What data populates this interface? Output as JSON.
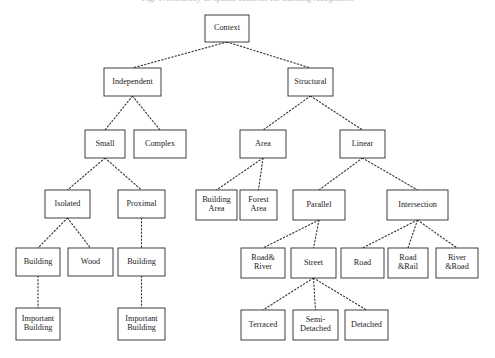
{
  "figure": {
    "caption": "Fig. 1. Hierarchy of spatial contexts for building recognition",
    "edge_style": "dotted",
    "box_stroke_color": "#2a2a2a",
    "box_fill_color": "#ffffff",
    "background_color": "#ffffff"
  },
  "nodes": [
    {
      "id": "context",
      "label": "Context",
      "lines": [
        "Context"
      ],
      "x": 205,
      "y": 15,
      "w": 44,
      "h": 27
    },
    {
      "id": "independent",
      "label": "Independent",
      "lines": [
        "Independent"
      ],
      "x": 104,
      "y": 68,
      "w": 57,
      "h": 28
    },
    {
      "id": "structural",
      "label": "Structural",
      "lines": [
        "Structural"
      ],
      "x": 288,
      "y": 68,
      "w": 45,
      "h": 28
    },
    {
      "id": "small",
      "label": "Small",
      "lines": [
        "Small"
      ],
      "x": 85,
      "y": 130,
      "w": 40,
      "h": 28
    },
    {
      "id": "complex",
      "label": "Complex",
      "lines": [
        "Complex"
      ],
      "x": 134,
      "y": 130,
      "w": 52,
      "h": 28
    },
    {
      "id": "area",
      "label": "Area",
      "lines": [
        "Area"
      ],
      "x": 240,
      "y": 130,
      "w": 46,
      "h": 28
    },
    {
      "id": "linear",
      "label": "Linear",
      "lines": [
        "Linear"
      ],
      "x": 340,
      "y": 130,
      "w": 45,
      "h": 28
    },
    {
      "id": "isolated",
      "label": "Isolated",
      "lines": [
        "Isolated"
      ],
      "x": 45,
      "y": 190,
      "w": 45,
      "h": 28
    },
    {
      "id": "proximal",
      "label": "Proximal",
      "lines": [
        "Proximal"
      ],
      "x": 118,
      "y": 190,
      "w": 47,
      "h": 28
    },
    {
      "id": "building-area",
      "label": "Building Area",
      "lines": [
        "Building",
        "Area"
      ],
      "x": 196,
      "y": 190,
      "w": 41,
      "h": 30
    },
    {
      "id": "forest-area",
      "label": "Forest Area",
      "lines": [
        "Forest",
        "Area"
      ],
      "x": 240,
      "y": 190,
      "w": 37,
      "h": 30
    },
    {
      "id": "parallel",
      "label": "Parallel",
      "lines": [
        "Parallel"
      ],
      "x": 293,
      "y": 190,
      "w": 52,
      "h": 30
    },
    {
      "id": "intersection",
      "label": "Intersection",
      "lines": [
        "Intersection"
      ],
      "x": 387,
      "y": 190,
      "w": 61,
      "h": 30
    },
    {
      "id": "building-isolated",
      "label": "Building",
      "lines": [
        "Building"
      ],
      "x": 16,
      "y": 248,
      "w": 44,
      "h": 28
    },
    {
      "id": "wood",
      "label": "Wood",
      "lines": [
        "Wood"
      ],
      "x": 68,
      "y": 248,
      "w": 45,
      "h": 28
    },
    {
      "id": "building-proximal",
      "label": "Building",
      "lines": [
        "Building"
      ],
      "x": 118,
      "y": 248,
      "w": 47,
      "h": 28
    },
    {
      "id": "road-river",
      "label": "Road& River",
      "lines": [
        "Road&",
        "River"
      ],
      "x": 241,
      "y": 248,
      "w": 44,
      "h": 30
    },
    {
      "id": "street",
      "label": "Street",
      "lines": [
        "Street"
      ],
      "x": 291,
      "y": 248,
      "w": 45,
      "h": 30
    },
    {
      "id": "road",
      "label": "Road",
      "lines": [
        "Road"
      ],
      "x": 341,
      "y": 248,
      "w": 43,
      "h": 30
    },
    {
      "id": "road-rail",
      "label": "Road &Rail",
      "lines": [
        "Road",
        "&Rail"
      ],
      "x": 388,
      "y": 248,
      "w": 40,
      "h": 30
    },
    {
      "id": "river-road",
      "label": "River &Road",
      "lines": [
        "River",
        "&Road"
      ],
      "x": 436,
      "y": 248,
      "w": 42,
      "h": 30
    },
    {
      "id": "important-building-1",
      "label": "Important Building",
      "lines": [
        "Important",
        "Building"
      ],
      "x": 16,
      "y": 308,
      "w": 44,
      "h": 32
    },
    {
      "id": "important-building-2",
      "label": "Important Building",
      "lines": [
        "Important",
        "Building"
      ],
      "x": 118,
      "y": 308,
      "w": 47,
      "h": 32
    },
    {
      "id": "terraced",
      "label": "Terraced",
      "lines": [
        "Terraced"
      ],
      "x": 241,
      "y": 310,
      "w": 44,
      "h": 30
    },
    {
      "id": "semi-detached",
      "label": "Semi-Detached",
      "lines": [
        "Semi-",
        "Detached"
      ],
      "x": 293,
      "y": 310,
      "w": 45,
      "h": 30
    },
    {
      "id": "detached",
      "label": "Detached",
      "lines": [
        "Detached"
      ],
      "x": 345,
      "y": 310,
      "w": 43,
      "h": 30
    }
  ],
  "edges": [
    {
      "from": "context",
      "to": "independent"
    },
    {
      "from": "context",
      "to": "structural"
    },
    {
      "from": "independent",
      "to": "small"
    },
    {
      "from": "independent",
      "to": "complex"
    },
    {
      "from": "structural",
      "to": "area"
    },
    {
      "from": "structural",
      "to": "linear"
    },
    {
      "from": "small",
      "to": "isolated"
    },
    {
      "from": "small",
      "to": "proximal"
    },
    {
      "from": "area",
      "to": "building-area"
    },
    {
      "from": "area",
      "to": "forest-area"
    },
    {
      "from": "linear",
      "to": "parallel"
    },
    {
      "from": "linear",
      "to": "intersection"
    },
    {
      "from": "isolated",
      "to": "building-isolated"
    },
    {
      "from": "isolated",
      "to": "wood"
    },
    {
      "from": "proximal",
      "to": "building-proximal"
    },
    {
      "from": "parallel",
      "to": "road-river"
    },
    {
      "from": "parallel",
      "to": "street"
    },
    {
      "from": "intersection",
      "to": "road"
    },
    {
      "from": "intersection",
      "to": "road-rail"
    },
    {
      "from": "intersection",
      "to": "river-road"
    },
    {
      "from": "building-isolated",
      "to": "important-building-1"
    },
    {
      "from": "building-proximal",
      "to": "important-building-2"
    },
    {
      "from": "street",
      "to": "terraced"
    },
    {
      "from": "street",
      "to": "semi-detached"
    },
    {
      "from": "street",
      "to": "detached"
    }
  ]
}
